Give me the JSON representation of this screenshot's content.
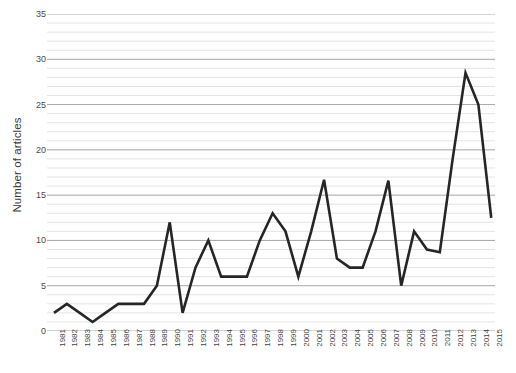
{
  "chart_data": {
    "type": "line",
    "title": "",
    "xlabel": "",
    "ylabel": "Number of articles",
    "ylim": [
      0,
      35
    ],
    "yticks": [
      0,
      5,
      10,
      15,
      20,
      25,
      30,
      35
    ],
    "minor_gridlines": true,
    "minor_tick_step": 1,
    "grid": true,
    "legend": false,
    "legend_position": "none",
    "line_color": "#262626",
    "line_width": 2.6,
    "categories": [
      "1981",
      "1982",
      "1983",
      "1984",
      "1985",
      "1986",
      "1987",
      "1988",
      "1989",
      "1990",
      "1991",
      "1992",
      "1993",
      "1994",
      "1995",
      "1996",
      "1997",
      "1998",
      "1999",
      "2000",
      "2001",
      "2002",
      "2003",
      "2004",
      "2005",
      "2006",
      "2007",
      "2008",
      "2009",
      "2010",
      "2011",
      "2012",
      "2013",
      "2014",
      "2015"
    ],
    "values": [
      2,
      3,
      2,
      1,
      2,
      3,
      3,
      3,
      5,
      12,
      2,
      7,
      10,
      6,
      6,
      6,
      10,
      13,
      11,
      6,
      11,
      16.7,
      8,
      7,
      7,
      11,
      16.6,
      5,
      11,
      9,
      8.7,
      19,
      28.5,
      25,
      12.5
    ],
    "series": [
      {
        "name": "Number of articles",
        "values": [
          2,
          3,
          2,
          1,
          2,
          3,
          3,
          3,
          5,
          12,
          2,
          7,
          10,
          6,
          6,
          6,
          10,
          13,
          11,
          6,
          11,
          16.7,
          8,
          7,
          7,
          11,
          16.6,
          5,
          11,
          9,
          8.7,
          19,
          28.5,
          25,
          12.5
        ]
      }
    ]
  },
  "axis": {
    "y_title": "Number of articles",
    "y_tick_labels": [
      "0",
      "5",
      "10",
      "15",
      "20",
      "25",
      "30",
      "35"
    ],
    "x_tick_labels": [
      "1981",
      "1982",
      "1983",
      "1984",
      "1985",
      "1986",
      "1987",
      "1988",
      "1989",
      "1990",
      "1991",
      "1992",
      "1993",
      "1994",
      "1995",
      "1996",
      "1997",
      "1998",
      "1999",
      "2000",
      "2001",
      "2002",
      "2003",
      "2004",
      "2005",
      "2006",
      "2007",
      "2008",
      "2009",
      "2010",
      "2011",
      "2012",
      "2013",
      "2014",
      "2015"
    ]
  },
  "colors": {
    "line": "#262626",
    "major_grid": "#a6a6a6",
    "minor_grid": "#e4e4e4",
    "text": "#3f3f3f"
  }
}
